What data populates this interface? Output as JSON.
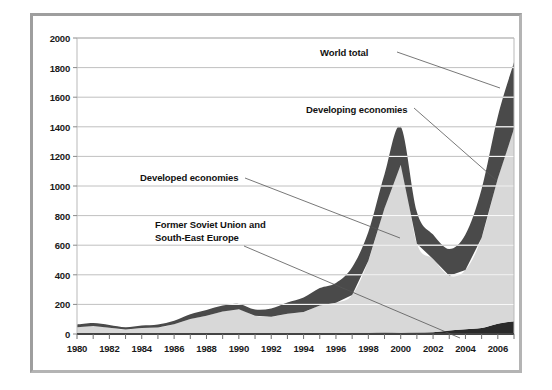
{
  "figure": {
    "background_color": "#ffffff",
    "frame_color": "#b4b4b4",
    "plot_background_color": "#ffffff"
  },
  "chart_data": {
    "type": "area",
    "title": "",
    "subtitle": "",
    "xlabel": "",
    "ylabel": "",
    "stacked": true,
    "grid": true,
    "grid_axis": "y",
    "legend_position": "annotations-in-plot",
    "xlim": [
      1980,
      2007
    ],
    "ylim": [
      0,
      2000
    ],
    "ytick_step": 200,
    "yticks": [
      0,
      200,
      400,
      600,
      800,
      1000,
      1200,
      1400,
      1600,
      1800,
      2000
    ],
    "ytick_labels": [
      "0",
      "200",
      "400",
      "600",
      "800",
      "1000",
      "1200",
      "1400",
      "1600",
      "1800",
      "2000"
    ],
    "xticks": [
      1980,
      1981,
      1982,
      1983,
      1984,
      1985,
      1986,
      1987,
      1988,
      1989,
      1990,
      1991,
      1992,
      1993,
      1994,
      1995,
      1996,
      1997,
      1998,
      1999,
      2000,
      2001,
      2002,
      2003,
      2004,
      2005,
      2006,
      2007
    ],
    "xtick_labels": [
      "1980",
      "",
      "1982",
      "",
      "1984",
      "",
      "1986",
      "",
      "1988",
      "",
      "1990",
      "",
      "1992",
      "",
      "1994",
      "",
      "1996",
      "",
      "1998",
      "",
      "2000",
      "",
      "2002",
      "",
      "2004",
      "",
      "2006",
      ""
    ],
    "x": [
      1980,
      1981,
      1982,
      1983,
      1984,
      1985,
      1986,
      1987,
      1988,
      1989,
      1990,
      1991,
      1992,
      1993,
      1994,
      1995,
      1996,
      1997,
      1998,
      1999,
      2000,
      2001,
      2002,
      2003,
      2004,
      2005,
      2006,
      2007
    ],
    "series": [
      {
        "name": "Former Soviet Union and South-East Europe",
        "color": "#2a2a2a",
        "stack_order": 0,
        "values": [
          0,
          0,
          0,
          0,
          0,
          0,
          0,
          0,
          0,
          0,
          2,
          3,
          4,
          6,
          6,
          6,
          7,
          9,
          9,
          10,
          9,
          10,
          12,
          24,
          32,
          40,
          70,
          86
        ]
      },
      {
        "name": "Developed economies",
        "color": "#d8d8d8",
        "stack_order": 1,
        "values": [
          46,
          54,
          43,
          30,
          40,
          44,
          66,
          102,
          124,
          152,
          165,
          120,
          112,
          130,
          142,
          186,
          204,
          254,
          486,
          840,
          1134,
          600,
          495,
          370,
          400,
          610,
          980,
          1300
        ]
      },
      {
        "name": "Developing economies",
        "color": "#4a4a4a",
        "stack_order": 2,
        "values": [
          18,
          20,
          18,
          16,
          18,
          21,
          24,
          32,
          38,
          40,
          36,
          43,
          57,
          77,
          98,
          118,
          134,
          188,
          195,
          230,
          257,
          215,
          165,
          180,
          240,
          330,
          420,
          450
        ]
      }
    ],
    "totals": {
      "name": "World total",
      "values": [
        64,
        74,
        61,
        46,
        58,
        65,
        90,
        134,
        162,
        192,
        203,
        166,
        173,
        213,
        246,
        310,
        345,
        451,
        690,
        1080,
        1400,
        825,
        672,
        574,
        672,
        980,
        1470,
        1836
      ]
    },
    "annotations": [
      {
        "label": "World total",
        "text_x": 320,
        "text_y": 47,
        "leader_from_x": 397,
        "leader_from_y": 52,
        "leader_to_x": 500,
        "leader_to_y": 88
      },
      {
        "label": "Developing economies",
        "text_x": 306,
        "text_y": 104,
        "leader_from_x": 414,
        "leader_from_y": 108,
        "leader_to_x": 496,
        "leader_to_y": 180
      },
      {
        "label": "Developed economies",
        "text_x": 140,
        "text_y": 172,
        "leader_from_x": 245,
        "leader_from_y": 178,
        "leader_to_x": 400,
        "leader_to_y": 238
      },
      {
        "label": "Former Soviet Union and\nSouth-East Europe",
        "text_x": 155,
        "text_y": 219,
        "leader_from_x": 244,
        "leader_from_y": 246,
        "leader_to_x": 460,
        "leader_to_y": 338
      }
    ]
  }
}
